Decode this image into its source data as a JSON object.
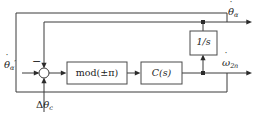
{
  "diagram": {
    "type": "control-block-diagram",
    "background_color": "#ffffff",
    "line_color": "#3a3a3a",
    "text_color": "#1c1c1c",
    "blocks": [
      {
        "id": "mod-block",
        "label": "mod(±π)",
        "label_plain": "mod(+/- pi)",
        "x": 67,
        "y": 62,
        "width": 60,
        "height": 22
      },
      {
        "id": "controller-block",
        "label": "C(s)",
        "label_plain": "C(s)",
        "x": 141,
        "y": 62,
        "width": 41,
        "height": 22
      },
      {
        "id": "integrator-block",
        "label": "1/s",
        "label_plain": "1/s",
        "x": 190,
        "y": 31,
        "width": 27,
        "height": 24
      }
    ],
    "summing_junction": {
      "id": "sum-junction",
      "cx": 44,
      "cy": 73,
      "r": 5,
      "negative_sign": "−",
      "negative_sign_label": "minus"
    },
    "signals": {
      "reference_input": {
        "symbol": "θ",
        "accent": "˙",
        "subscript": "α",
        "prime": "′",
        "plain": "theta-hat-alpha-prime",
        "position": "left"
      },
      "disturbance_input": {
        "symbol": "θ",
        "prefix": "Δ",
        "subscript": "c",
        "plain": "delta-theta-c",
        "position": "bottom"
      },
      "angle_output": {
        "symbol": "θ",
        "accent": "˙",
        "subscript": "α",
        "plain": "theta-hat-alpha",
        "position": "top-right"
      },
      "rate_output": {
        "symbol": "ω",
        "accent": "˙",
        "subscript": "2n",
        "plain": "omega-hat-2n",
        "position": "right"
      }
    },
    "junction_dots": [
      {
        "id": "upper-tap",
        "cx": 203,
        "cy": 22
      },
      {
        "id": "lower-tap",
        "cx": 203,
        "cy": 73
      }
    ]
  }
}
